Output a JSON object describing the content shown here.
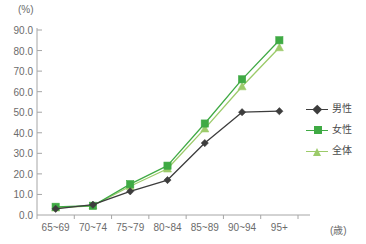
{
  "chart_data": {
    "type": "line",
    "title": "",
    "xlabel": "(歳)",
    "ylabel": "(%)",
    "categories": [
      "65~69",
      "70~74",
      "75~79",
      "80~84",
      "85~89",
      "90~94",
      "95+"
    ],
    "ylim": [
      0,
      90
    ],
    "ytick_step": 10,
    "ytick_labels": [
      "90.0",
      "80.0",
      "70.0",
      "60.0",
      "50.0",
      "40.0",
      "30.0",
      "20.0",
      "10.0",
      "0.0"
    ],
    "ytick_values": [
      90,
      80,
      70,
      60,
      50,
      40,
      30,
      20,
      10,
      0
    ],
    "grid": false,
    "legend_position": "right",
    "series": [
      {
        "name": "男性",
        "color": "#3d3d3d",
        "marker": "diamond",
        "values": [
          3.0,
          5.0,
          11.5,
          17.0,
          35.0,
          50.0,
          50.5
        ]
      },
      {
        "name": "女性",
        "color": "#3faa44",
        "marker": "square",
        "values": [
          4.0,
          4.5,
          15.0,
          24.0,
          44.5,
          66.0,
          85.0
        ]
      },
      {
        "name": "全体",
        "color": "#9ccb6a",
        "marker": "triangle",
        "values": [
          3.5,
          4.5,
          14.0,
          22.5,
          42.0,
          62.5,
          81.5
        ]
      }
    ]
  },
  "axis": {
    "y_unit": "(%)",
    "x_unit": "(歳)",
    "axis_color": "#a6a6a6"
  },
  "legend": {
    "items": [
      {
        "label": "男性"
      },
      {
        "label": "女性"
      },
      {
        "label": "全体"
      }
    ]
  }
}
